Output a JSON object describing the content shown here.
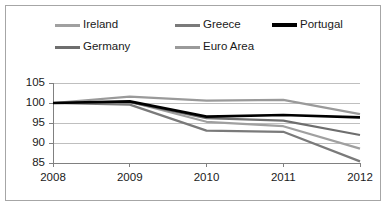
{
  "chart_data": {
    "type": "line",
    "title": "",
    "subtitle": "",
    "xlabel": "",
    "ylabel": "",
    "categories": [
      "2008",
      "2009",
      "2010",
      "2011",
      "2012"
    ],
    "x": [
      2008,
      2009,
      2010,
      2011,
      2012
    ],
    "ylim": [
      85,
      105
    ],
    "yticks": [
      85,
      90,
      95,
      100,
      105
    ],
    "ytick_labels": [
      "85",
      "90",
      "95",
      "100",
      "105"
    ],
    "xtick_labels": [
      "2008",
      "2009",
      "2010",
      "2011",
      "2012"
    ],
    "grid": true,
    "grid_axis": "y",
    "legend_position": "top",
    "series": [
      {
        "name": "Ireland",
        "color": "#a0a0a0",
        "width": 2.2,
        "values": [
          100,
          100.3,
          95.3,
          94.2,
          88.6
        ]
      },
      {
        "name": "Greece",
        "color": "#7a7a7a",
        "width": 2.2,
        "values": [
          100,
          99.6,
          93.1,
          92.8,
          85.4
        ]
      },
      {
        "name": "Portugal",
        "color": "#000000",
        "width": 2.6,
        "values": [
          100,
          100.4,
          96.6,
          97.0,
          96.4
        ]
      },
      {
        "name": "Germany",
        "color": "#6e6e6e",
        "width": 2.2,
        "values": [
          100,
          100.2,
          96.2,
          95.6,
          92.0
        ]
      },
      {
        "name": "Euro Area",
        "color": "#9a9a9a",
        "width": 2.2,
        "values": [
          100,
          101.6,
          100.6,
          100.8,
          97.2
        ]
      }
    ],
    "axis_color": "#808080",
    "grid_color": "#bfbfbf",
    "plot_background": "#ffffff",
    "border_color": "#a6a6a6"
  },
  "legend": {
    "rows": [
      [
        {
          "label": "Ireland",
          "series_index": 0
        },
        {
          "label": "Greece",
          "series_index": 1
        },
        {
          "label": "Portugal",
          "series_index": 2
        }
      ],
      [
        {
          "label": "Germany",
          "series_index": 3
        },
        {
          "label": "Euro Area",
          "series_index": 4
        }
      ]
    ],
    "row_item_left": [
      55,
      175,
      272
    ]
  },
  "plot_geometry": {
    "left": 53,
    "right": 360,
    "top": 83,
    "bottom": 163
  }
}
